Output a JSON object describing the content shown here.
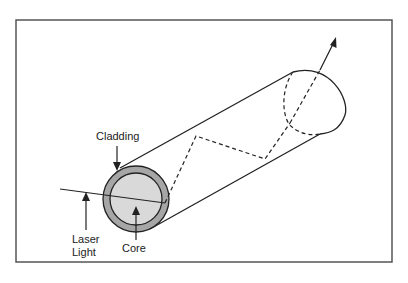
{
  "diagram": {
    "labels": {
      "cladding": "Cladding",
      "core": "Core",
      "laser_line1": "Laser",
      "laser_line2": "Light"
    },
    "colors": {
      "frame": "#555555",
      "stroke": "#222222",
      "cladding_fill": "#a6a6a6",
      "core_fill": "#d9d9d9"
    }
  }
}
